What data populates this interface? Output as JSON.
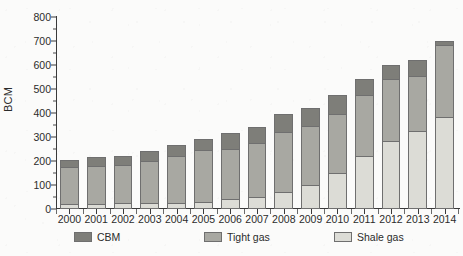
{
  "chart_data": {
    "type": "bar",
    "title": "",
    "subtitle": "",
    "xlabel": "",
    "ylabel": "BCM",
    "ylim": [
      0,
      800
    ],
    "ytick_step": 100,
    "yticks": [
      0,
      100,
      200,
      300,
      400,
      500,
      600,
      700,
      800
    ],
    "grid": false,
    "stacked": true,
    "stack_order_bottom_to_top": [
      "Shale gas",
      "Tight gas",
      "CBM"
    ],
    "legend_position": "bottom",
    "categories": [
      "2000",
      "2001",
      "2002",
      "2003",
      "2004",
      "2005",
      "2006",
      "2007",
      "2008",
      "2009",
      "2010",
      "2011",
      "2012",
      "2013",
      "2014"
    ],
    "series": [
      {
        "name": "Shale gas",
        "color": "#dcdcd6",
        "values": [
          20,
          20,
          25,
          25,
          25,
          30,
          40,
          50,
          70,
          100,
          150,
          220,
          285,
          325,
          385
        ]
      },
      {
        "name": "Tight gas",
        "color": "#a8a8a2",
        "values": [
          155,
          160,
          160,
          175,
          195,
          215,
          210,
          225,
          250,
          245,
          245,
          255,
          255,
          230,
          300
        ]
      },
      {
        "name": "CBM",
        "color": "#7e7e79",
        "values": [
          30,
          35,
          38,
          40,
          45,
          45,
          65,
          65,
          75,
          75,
          80,
          65,
          60,
          67,
          15
        ]
      }
    ],
    "totals": [
      205,
      215,
      223,
      240,
      265,
      290,
      315,
      340,
      395,
      420,
      475,
      540,
      600,
      622,
      700
    ]
  },
  "legend": {
    "items": [
      {
        "label": "CBM",
        "color": "#7e7e79"
      },
      {
        "label": "Tight gas",
        "color": "#a8a8a2"
      },
      {
        "label": "Shale gas",
        "color": "#dcdcd6"
      }
    ]
  },
  "axis": {
    "y_title": "BCM"
  }
}
